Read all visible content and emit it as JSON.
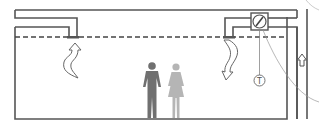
{
  "diagram": {
    "colors": {
      "line": "#555555",
      "man": "#707070",
      "woman": "#b5b5b5",
      "arrow": "#6a6a6a",
      "thin_line": "#888888",
      "curve": "#9a9a9a"
    },
    "labels": {
      "thermostat": "T"
    },
    "elements": {
      "supply_duct": "supply-duct",
      "return_duct": "return-duct",
      "damper": "damper-fan",
      "suspended_ceiling": "dashed-ceiling-line",
      "vertical_shaft": "vertical-shaft",
      "shaft_arrow": "up-arrow",
      "intake_arrow": "rising-airflow-arrow",
      "outlet_arrow": "falling-airflow-arrow",
      "man": "man-figure",
      "woman": "woman-figure",
      "thermostat": "thermostat"
    }
  }
}
